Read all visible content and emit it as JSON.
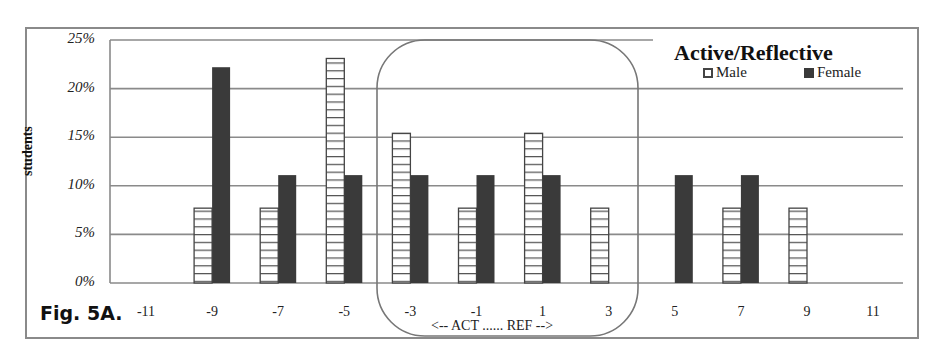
{
  "figure": {
    "label": "Fig. 5A.",
    "title": "Active/Reflective",
    "y_axis_label": "students",
    "annotation": "<-- ACT ...... REF -->"
  },
  "legend": [
    {
      "name": "Male",
      "style": "hatched",
      "color": "#ffffff",
      "stroke": "#444444"
    },
    {
      "name": "Female",
      "style": "solid",
      "color": "#3a3a3a"
    }
  ],
  "y_ticks": [
    "0%",
    "5%",
    "10%",
    "15%",
    "20%",
    "25%"
  ],
  "x_ticks": [
    "-11",
    "-9",
    "-7",
    "-5",
    "-3",
    "-1",
    "1",
    "3",
    "5",
    "7",
    "9",
    "11"
  ],
  "chart_data": {
    "type": "bar",
    "title": "Active/Reflective",
    "xlabel": "<-- ACT ...... REF -->",
    "ylabel": "students",
    "categories": [
      "-11",
      "-9",
      "-7",
      "-5",
      "-3",
      "-1",
      "1",
      "3",
      "5",
      "7",
      "9",
      "11"
    ],
    "series": [
      {
        "name": "Male",
        "values": [
          0,
          7.7,
          7.7,
          23.1,
          15.4,
          7.7,
          15.4,
          7.7,
          0,
          7.7,
          7.7,
          0
        ]
      },
      {
        "name": "Female",
        "values": [
          0,
          22.2,
          11.1,
          11.1,
          11.1,
          11.1,
          11.1,
          0,
          11.1,
          11.1,
          0,
          0
        ]
      }
    ],
    "ylim": [
      0,
      25
    ],
    "y_unit": "%",
    "grid": true,
    "legend_position": "top-right",
    "annotations": [
      "Rounded box highlighting categories -3 to 3",
      "Fig. 5A."
    ]
  }
}
